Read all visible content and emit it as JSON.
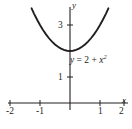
{
  "figure": {
    "background_color": "#ffffff",
    "stroke_color": "#231f20"
  },
  "axes": {
    "x_axis_label": "x",
    "y_axis_label": "y",
    "x_tick_labels": [
      "-2",
      "-1",
      "1",
      "2"
    ],
    "y_tick_labels": [
      "1",
      "3"
    ]
  },
  "annotations": {
    "equation_lhs": "y",
    "equation_eq": " = ",
    "equation_const": "2",
    "equation_plus": " + ",
    "equation_var": "x",
    "equation_exp": "2"
  },
  "chart_data": {
    "type": "line",
    "title": "",
    "subtitle": "",
    "xlabel": "x",
    "ylabel": "y",
    "function": "y = 2 + x^2",
    "annotations": [
      {
        "text": "y = 2 + x²",
        "x": 0.1,
        "y": 1.7
      }
    ],
    "legend": [],
    "legend_position": "none",
    "grid": false,
    "xlim": [
      -2.35,
      2.35
    ],
    "ylim": [
      -0.35,
      4.7
    ],
    "xticks": [
      -2,
      -1,
      1,
      2
    ],
    "xtick_labels": [
      "-2",
      "-1",
      "1",
      "2"
    ],
    "yticks": [
      1,
      3
    ],
    "ytick_labels": [
      "1",
      "3"
    ],
    "series": [
      {
        "name": "y = 2 + x^2",
        "color": "#231f20",
        "x": [
          -1.28,
          -1.2,
          -1.1,
          -1.0,
          -0.9,
          -0.8,
          -0.7,
          -0.6,
          -0.5,
          -0.4,
          -0.3,
          -0.2,
          -0.1,
          0.0,
          0.1,
          0.2,
          0.3,
          0.4,
          0.5,
          0.6,
          0.7,
          0.8,
          0.9,
          1.0,
          1.1,
          1.2,
          1.28
        ],
        "y": [
          3.64,
          3.44,
          3.21,
          3.0,
          2.81,
          2.64,
          2.49,
          2.36,
          2.25,
          2.16,
          2.09,
          2.04,
          2.01,
          2.0,
          2.01,
          2.04,
          2.09,
          2.16,
          2.25,
          2.36,
          2.49,
          2.64,
          2.81,
          3.0,
          3.21,
          3.44,
          3.64
        ]
      }
    ]
  }
}
